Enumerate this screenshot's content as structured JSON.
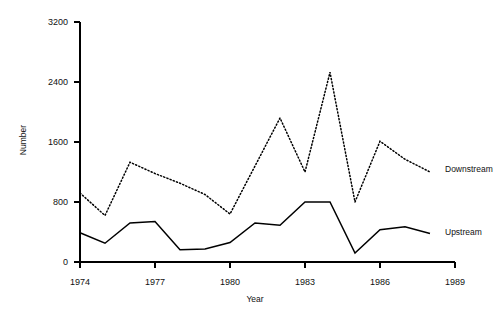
{
  "chart_data": {
    "type": "line",
    "title": "",
    "xlabel": "Year",
    "ylabel": "Number",
    "xlim": [
      1974,
      1989
    ],
    "ylim": [
      0,
      3200
    ],
    "grid": false,
    "legend_position": "inline-right-end-of-line",
    "yticks": [
      0,
      800,
      1600,
      2400,
      3200
    ],
    "ytick_labels": [
      "0",
      "800",
      "1600",
      "2400",
      "3200"
    ],
    "xticks": [
      1974,
      1977,
      1980,
      1983,
      1986,
      1989
    ],
    "xtick_labels": [
      "1974",
      "1977",
      "1980",
      "1983",
      "1986",
      "1989"
    ],
    "x": [
      1974,
      1975,
      1976,
      1977,
      1978,
      1979,
      1980,
      1981,
      1982,
      1983,
      1984,
      1985,
      1986,
      1987,
      1988
    ],
    "series": [
      {
        "name": "Downstream",
        "style": "dotted",
        "color": "#000000",
        "values": [
          920,
          620,
          1330,
          1180,
          1050,
          900,
          640,
          1280,
          1920,
          1200,
          2530,
          800,
          1610,
          1370,
          1200
        ]
      },
      {
        "name": "Upstream",
        "style": "solid",
        "color": "#000000",
        "values": [
          390,
          250,
          520,
          540,
          165,
          175,
          260,
          520,
          490,
          800,
          800,
          120,
          430,
          470,
          380
        ]
      }
    ],
    "annotations": [
      {
        "text": "Downstream",
        "x": 1988.6,
        "y": 1240
      },
      {
        "text": "Upstream",
        "x": 1988.6,
        "y": 395
      }
    ]
  }
}
